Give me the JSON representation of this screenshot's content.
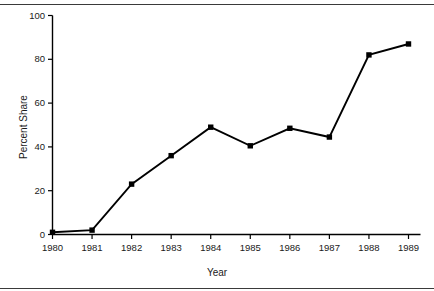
{
  "chart_data": {
    "type": "line",
    "title": "",
    "xlabel": "Year",
    "ylabel": "Percent Share",
    "categories": [
      "1980",
      "1981",
      "1982",
      "1983",
      "1984",
      "1985",
      "1986",
      "1987",
      "1988",
      "1989"
    ],
    "values": [
      1,
      2,
      23,
      36,
      49,
      40.5,
      48.5,
      44.5,
      82,
      87
    ],
    "x_tick_labels": [
      "1980",
      "1981",
      "1982",
      "1983",
      "1984",
      "1985",
      "1986",
      "1987",
      "1988",
      "1989"
    ],
    "y_tick_labels": [
      "0",
      "20",
      "40",
      "60",
      "80",
      "100"
    ],
    "y_ticks": [
      0,
      20,
      40,
      60,
      80,
      100
    ],
    "ylim": [
      0,
      100
    ],
    "grid": false,
    "legend": null,
    "marker": "filled-square",
    "line_color": "#000000",
    "marker_color": "#000000",
    "background_color": "#ffffff",
    "axis_color": "#000000"
  },
  "labels": {
    "y_axis_title": "Percent Share",
    "x_axis_title": "Year",
    "y_ticks": [
      "100",
      "80",
      "60",
      "40",
      "20",
      "0"
    ],
    "x_ticks": [
      "1980",
      "1981",
      "1982",
      "1983",
      "1984",
      "1985",
      "1986",
      "1987",
      "1988",
      "1989"
    ]
  }
}
